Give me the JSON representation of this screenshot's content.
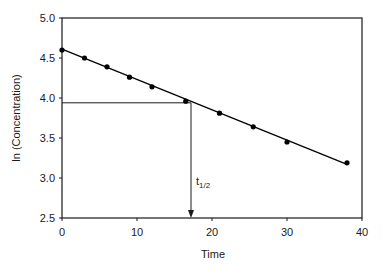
{
  "chart_data": {
    "type": "scatter",
    "title": "",
    "xlabel": "Time",
    "ylabel": "ln (Concentration)",
    "xlim": [
      0,
      40
    ],
    "ylim": [
      2.5,
      5.0
    ],
    "xticks": [
      0,
      10,
      20,
      30,
      40
    ],
    "xtick_labels": [
      "0",
      "10",
      "20",
      "30",
      "40"
    ],
    "yticks": [
      2.5,
      3.0,
      3.5,
      4.0,
      4.5,
      5.0
    ],
    "ytick_labels": [
      "2.5",
      "3.0",
      "3.5",
      "4.0",
      "4.5",
      "5.0"
    ],
    "grid": false,
    "legend": null,
    "series": [
      {
        "name": "ln (Concentration)",
        "marker": "circle",
        "color": "#000000",
        "x": [
          0,
          3,
          6,
          9,
          12,
          16.5,
          21,
          25.5,
          30,
          38
        ],
        "y": [
          4.6,
          4.5,
          4.39,
          4.26,
          4.14,
          3.96,
          3.81,
          3.64,
          3.45,
          3.19
        ]
      }
    ],
    "fit_line": {
      "x": [
        0,
        38
      ],
      "y": [
        4.61,
        3.17
      ],
      "color": "#000000"
    },
    "annotations": [
      {
        "type": "half-life-marker",
        "label_main": "t",
        "label_sub": "1/2",
        "horizontal_y": 3.94,
        "vertical_x": 17.2
      }
    ]
  }
}
